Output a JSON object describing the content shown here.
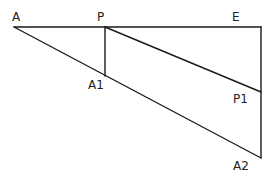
{
  "diagram": {
    "type": "geometry",
    "points": {
      "A": {
        "label": "A",
        "x": 14,
        "y": 27
      },
      "P": {
        "label": "P",
        "x": 105,
        "y": 27
      },
      "E": {
        "label": "E",
        "x": 261,
        "y": 27
      },
      "A1": {
        "label": "A1",
        "x": 105,
        "y": 76
      },
      "P1": {
        "label": "P1",
        "x": 261,
        "y": 92
      },
      "A2": {
        "label": "A2",
        "x": 261,
        "y": 158
      }
    },
    "segments": [
      {
        "from": "A",
        "to": "E"
      },
      {
        "from": "E",
        "to": "A2"
      },
      {
        "from": "A",
        "to": "A2"
      },
      {
        "from": "P",
        "to": "A1"
      },
      {
        "from": "P",
        "to": "P1"
      }
    ],
    "labels": {
      "A": "A",
      "P": "P",
      "E": "E",
      "A1": "A1",
      "P1": "P1",
      "A2": "A2"
    },
    "colors": {
      "line": "#1a1a1a",
      "text": "#222222",
      "background": "#ffffff"
    }
  }
}
